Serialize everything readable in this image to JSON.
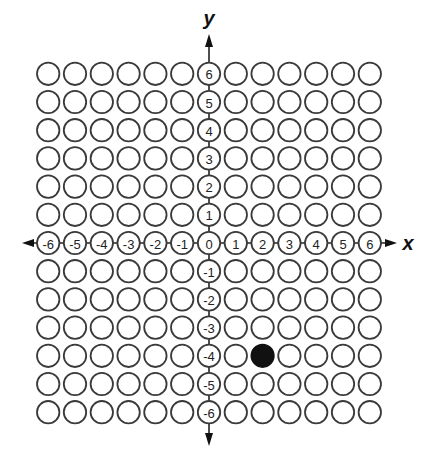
{
  "diagram": {
    "type": "coordinate-plane-grid",
    "x_axis_label": "x",
    "y_axis_label": "y",
    "x_range": [
      -6,
      6
    ],
    "y_range": [
      -6,
      6
    ],
    "grid_marker": "open-circle",
    "x_tick_labels": [
      "-6",
      "-5",
      "-4",
      "-3",
      "-2",
      "-1",
      "0",
      "1",
      "2",
      "3",
      "4",
      "5",
      "6"
    ],
    "y_tick_labels": [
      "6",
      "5",
      "4",
      "3",
      "2",
      "1",
      "0",
      "-1",
      "-2",
      "-3",
      "-4",
      "-5",
      "-6"
    ],
    "highlighted_points": [
      {
        "x": 2,
        "y": -4,
        "style": "filled"
      }
    ],
    "colors": {
      "circle_stroke": "#3a3a3a",
      "filled_point": "#111111",
      "background": "#ffffff"
    }
  }
}
